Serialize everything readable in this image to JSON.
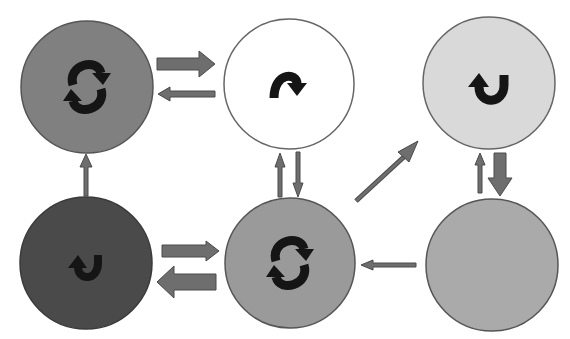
{
  "diagram": {
    "title": "",
    "background": "#ffffff",
    "arrow_color": "#6e6e6e",
    "arrow_stroke": "#4a4a4a",
    "icon_color": "#151515",
    "nodes": [
      {
        "id": "top-left",
        "cx": 87,
        "cy": 87,
        "r": 66,
        "fill": "#808080",
        "stroke": "#555555",
        "icon": "cycle-arrows-icon",
        "label": ""
      },
      {
        "id": "top-middle",
        "cx": 289,
        "cy": 84,
        "r": 65,
        "fill": "#ffffff",
        "stroke": "#666666",
        "icon": "curved-arrow-clockwise-over-icon",
        "label": ""
      },
      {
        "id": "top-right",
        "cx": 489,
        "cy": 83,
        "r": 66,
        "fill": "#d9d9d9",
        "stroke": "#666666",
        "icon": "u-turn-arrow-icon",
        "label": ""
      },
      {
        "id": "bottom-left",
        "cx": 86,
        "cy": 263,
        "r": 66,
        "fill": "#4a4a4a",
        "stroke": "#3a3a3a",
        "icon": "u-turn-arrow-icon",
        "label": ""
      },
      {
        "id": "bottom-middle",
        "cx": 290,
        "cy": 263,
        "r": 65,
        "fill": "#9a9a9a",
        "stroke": "#555555",
        "icon": "cycle-arrows-icon",
        "label": ""
      },
      {
        "id": "bottom-right",
        "cx": 492,
        "cy": 265,
        "r": 66,
        "fill": "#aaaaaa",
        "stroke": "#555555",
        "icon": "none",
        "label": ""
      }
    ],
    "edges": [
      {
        "from": "top-left",
        "to": "top-middle",
        "weight": "thick"
      },
      {
        "from": "top-middle",
        "to": "top-left",
        "weight": "thin"
      },
      {
        "from": "bottom-left",
        "to": "top-left",
        "weight": "thin"
      },
      {
        "from": "bottom-middle",
        "to": "top-middle",
        "weight": "thin"
      },
      {
        "from": "top-middle",
        "to": "bottom-middle",
        "weight": "thin"
      },
      {
        "from": "bottom-middle",
        "to": "top-right",
        "weight": "thin"
      },
      {
        "from": "bottom-right",
        "to": "top-right",
        "weight": "thin"
      },
      {
        "from": "top-right",
        "to": "bottom-right",
        "weight": "thick"
      },
      {
        "from": "bottom-left",
        "to": "bottom-middle",
        "weight": "medium"
      },
      {
        "from": "bottom-middle",
        "to": "bottom-left",
        "weight": "thick"
      },
      {
        "from": "bottom-right",
        "to": "bottom-middle",
        "weight": "thin"
      }
    ]
  }
}
